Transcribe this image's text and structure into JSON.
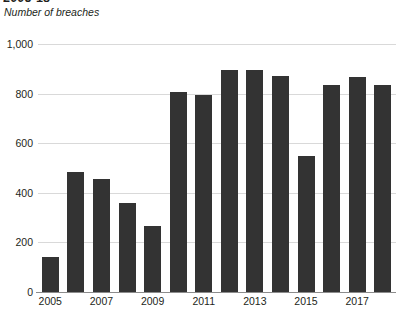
{
  "figure": {
    "title": "2005-18",
    "subtitle": "Number of breaches"
  },
  "chart_data": {
    "type": "bar",
    "title": "2005-18",
    "subtitle": "Number of breaches",
    "xlabel": "",
    "ylabel": "Number of breaches",
    "categories": [
      "2005",
      "2006",
      "2007",
      "2008",
      "2009",
      "2010",
      "2011",
      "2012",
      "2013",
      "2014",
      "2015",
      "2016",
      "2017",
      "2018"
    ],
    "values": [
      140,
      485,
      455,
      357,
      268,
      805,
      795,
      895,
      895,
      870,
      550,
      835,
      865,
      835
    ],
    "ylim": [
      0,
      1000
    ],
    "yticks": [
      0,
      200,
      400,
      600,
      800,
      1000
    ],
    "ytick_labels": [
      "0",
      "200",
      "400",
      "600",
      "800",
      "1,000"
    ],
    "xtick_labels": [
      "2005",
      "2007",
      "2009",
      "2011",
      "2013",
      "2015",
      "2017"
    ],
    "xtick_categories": [
      "2005",
      "2007",
      "2009",
      "2011",
      "2013",
      "2015",
      "2017"
    ],
    "grid": "horizontal",
    "legend": "none",
    "bar_color": "#333333",
    "gridline_color": "#d9d9d9",
    "axis_color": "#8c8c8c"
  }
}
